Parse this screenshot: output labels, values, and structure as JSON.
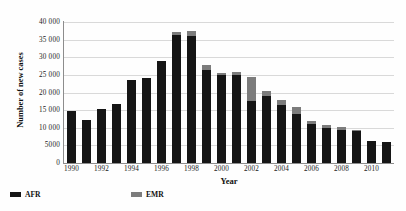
{
  "chart_data": {
    "type": "bar",
    "stacked": true,
    "title": "",
    "xlabel": "Year",
    "ylabel": "Number of new cases",
    "ylim": [
      0,
      40000
    ],
    "ytick_step": 5000,
    "ytick_labels": [
      "0",
      "5000",
      "10 000",
      "15 000",
      "20 000",
      "25 000",
      "30 000",
      "35 000",
      "40 000"
    ],
    "ytick_values": [
      0,
      5000,
      10000,
      15000,
      20000,
      25000,
      30000,
      35000,
      40000
    ],
    "grid": true,
    "legend_position": "bottom-left",
    "categories": [
      1990,
      1991,
      1992,
      1993,
      1994,
      1995,
      1996,
      1997,
      1998,
      1999,
      2000,
      2001,
      2002,
      2003,
      2004,
      2005,
      2006,
      2007,
      2008,
      2009,
      2010,
      2011
    ],
    "xtick_labels": [
      "1990",
      "1992",
      "1994",
      "1996",
      "1998",
      "2000",
      "2002",
      "2004",
      "2006",
      "2008",
      "2010"
    ],
    "xtick_values": [
      1990,
      1992,
      1994,
      1996,
      1998,
      2000,
      2002,
      2004,
      2006,
      2008,
      2010
    ],
    "series": [
      {
        "name": "AFR",
        "color": "#151515",
        "values": [
          14800,
          12200,
          15300,
          16800,
          23500,
          24000,
          29000,
          36400,
          36000,
          26500,
          25000,
          25000,
          17500,
          19000,
          16500,
          14000,
          11000,
          10000,
          9500,
          9000,
          6200,
          6000
        ]
      },
      {
        "name": "EMR",
        "color": "#7c7c7c",
        "values": [
          0,
          0,
          0,
          0,
          0,
          0,
          0,
          700,
          1500,
          1300,
          500,
          900,
          7000,
          1500,
          1500,
          1800,
          800,
          700,
          600,
          300,
          100,
          100
        ]
      }
    ],
    "totals": [
      14800,
      12200,
      15300,
      16800,
      23500,
      24000,
      29000,
      37100,
      37500,
      27800,
      25500,
      25900,
      24500,
      20500,
      18000,
      15800,
      11800,
      10700,
      10100,
      9300,
      6300,
      6100
    ]
  },
  "legend": {
    "items": [
      {
        "label": "AFR",
        "color": "#151515"
      },
      {
        "label": "EMR",
        "color": "#7c7c7c"
      }
    ]
  },
  "axes": {
    "x_title": "Year",
    "y_title": "Number of new cases"
  }
}
